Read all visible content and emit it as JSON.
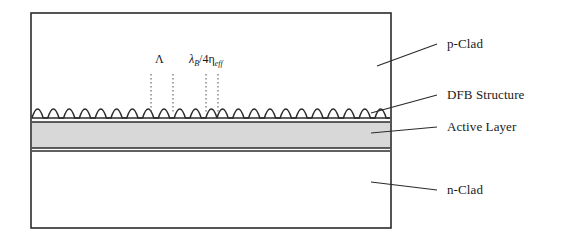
{
  "figure": {
    "type": "cross-section-diagram"
  },
  "labels": {
    "p_clad": "p-Clad",
    "dfb_structure": "DFB Structure",
    "active_layer": "Active Layer",
    "n_clad": "n-Clad"
  },
  "annotations": {
    "period_symbol": "Λ",
    "phase_shift": {
      "lambda": "λ",
      "lambda_sub": "B",
      "divider": "/4",
      "eta": "η",
      "eta_sub": "eff",
      "full_text": "λB/4ηeff"
    }
  },
  "geometry": {
    "box": {
      "x": 31,
      "y": 13,
      "width": 360,
      "height": 215
    },
    "grating": {
      "baseline_y": 118,
      "amplitude": 11,
      "period": 22.5,
      "start_x": 32,
      "end_x": 390,
      "phase_shift_position_x": 214
    },
    "active_layer": {
      "top_y": 122,
      "bottom_y": 148
    },
    "n_clad_divider_y": 150
  },
  "colors": {
    "stroke": "#2b2b2b",
    "active_fill": "#d8d8d8",
    "background": "#ffffff",
    "text": "#1a1a1a",
    "dotted": "#555555"
  },
  "leaders": {
    "p_clad": {
      "x1": 377,
      "y1": 66,
      "x2": 437,
      "y2": 44
    },
    "dfb_structure": {
      "x1": 371,
      "y1": 113,
      "x2": 437,
      "y2": 95
    },
    "active_layer": {
      "x1": 371,
      "y1": 132,
      "x2": 437,
      "y2": 127
    },
    "n_clad": {
      "x1": 371,
      "y1": 182,
      "x2": 437,
      "y2": 190
    }
  },
  "dotted_lines": {
    "period_left_x": 151,
    "period_right_x": 173,
    "shift_left_x": 206,
    "shift_right_x": 218,
    "top_y": 74,
    "bottom_y": 113
  }
}
